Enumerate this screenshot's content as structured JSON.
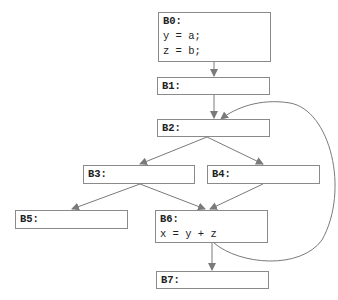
{
  "diagram": {
    "type": "control-flow-graph",
    "colors": {
      "edge": "#7a7a7a",
      "border": "#8a8a8a",
      "text": "#222222"
    },
    "blocks": [
      {
        "id": "B0",
        "label": "B0:",
        "lines": [
          "y = a;",
          "z = b;"
        ]
      },
      {
        "id": "B1",
        "label": "B1:",
        "lines": []
      },
      {
        "id": "B2",
        "label": "B2:",
        "lines": []
      },
      {
        "id": "B3",
        "label": "B3:",
        "lines": []
      },
      {
        "id": "B4",
        "label": "B4:",
        "lines": []
      },
      {
        "id": "B5",
        "label": "B5:",
        "lines": []
      },
      {
        "id": "B6",
        "label": "B6:",
        "lines": [
          "x = y + z"
        ]
      },
      {
        "id": "B7",
        "label": "B7:",
        "lines": []
      }
    ],
    "edges": [
      {
        "from": "B0",
        "to": "B1"
      },
      {
        "from": "B1",
        "to": "B2"
      },
      {
        "from": "B2",
        "to": "B3"
      },
      {
        "from": "B2",
        "to": "B4"
      },
      {
        "from": "B3",
        "to": "B5"
      },
      {
        "from": "B3",
        "to": "B6"
      },
      {
        "from": "B4",
        "to": "B6"
      },
      {
        "from": "B6",
        "to": "B7"
      },
      {
        "from": "B6",
        "to": "B2",
        "kind": "back-edge"
      }
    ]
  }
}
